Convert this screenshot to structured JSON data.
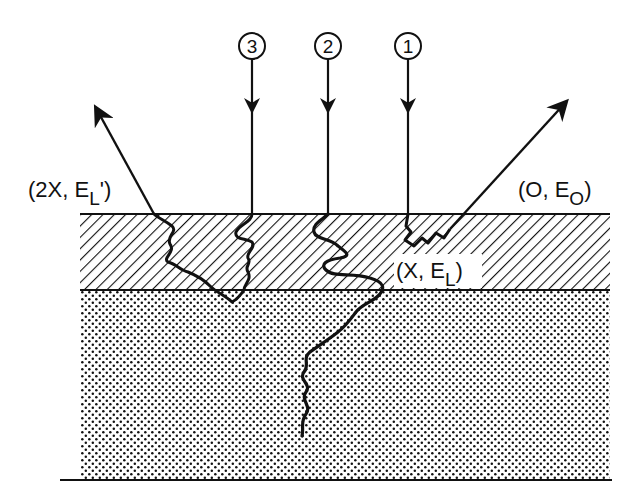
{
  "diagram": {
    "type": "ion-solid scattering schematic",
    "colors": {
      "ink": "#111111",
      "background": "#ffffff"
    },
    "regions": [
      {
        "name": "surface-layer",
        "pattern": "diagonal-hatch"
      },
      {
        "name": "substrate",
        "pattern": "stipple-dots"
      }
    ],
    "beams": [
      {
        "id": "1",
        "label": "1",
        "outcome": "backscattered at surface"
      },
      {
        "id": "2",
        "label": "2",
        "outcome": "penetrates into substrate"
      },
      {
        "id": "3",
        "label": "3",
        "outcome": "backscattered within layer"
      }
    ],
    "labels": {
      "surface_exit_open": "(O, E",
      "surface_exit_sub": "O",
      "surface_exit_close": ")",
      "depth_point_open": "(X, E",
      "depth_point_sub": "L",
      "depth_point_close": ")",
      "double_depth_open": "(2X, E",
      "double_depth_sub": "L",
      "double_depth_close": "')"
    }
  }
}
